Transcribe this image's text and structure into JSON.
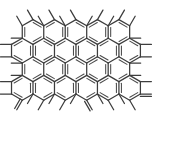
{
  "figure": {
    "title": "Polycyclic aromatic hydrocarbon lattice",
    "kind": "chemical-structure-diagram",
    "background_color": "#ffffff",
    "bond_color": "#3d3d3d",
    "inner_bond_color": "#4a4a4a",
    "bond_width": 1.25,
    "canvas": {
      "width": 184,
      "height": 144
    }
  },
  "lattice": {
    "orientation": "pointy-top",
    "hex_radius": 12.4,
    "origin_x": 33.0,
    "origin_y": 32.0,
    "col_step_x": 21.48,
    "row_step_y": 18.6,
    "rows": [
      {
        "index": 0,
        "count": 5,
        "offset_x": 0.0,
        "offset_y": 0.0
      },
      {
        "index": 1,
        "count": 6,
        "offset_x": -10.74,
        "offset_y": 18.6
      },
      {
        "index": 2,
        "count": 5,
        "offset_x": 0.0,
        "offset_y": 37.2
      },
      {
        "index": 3,
        "count": 6,
        "offset_x": -10.74,
        "offset_y": 55.8
      }
    ]
  },
  "substituents": {
    "methyl_length": 11.0,
    "top_stub_count": 5,
    "bottom_stub_count": 5,
    "left_stub_count": 3,
    "right_stub_count": 3,
    "double_bond_offset": 2.4,
    "exocyclic_double_bonds": [
      {
        "position": "left-lower",
        "label": "methylene"
      },
      {
        "position": "bottom-center",
        "label": "methylene"
      },
      {
        "position": "right-lower",
        "label": "methylene"
      }
    ]
  },
  "chart_data": {
    "type": "diagram",
    "title": "Polycyclic aromatic hydrocarbon lattice",
    "hexagon_rows": 4,
    "hexagons_per_row": [
      5,
      6,
      5,
      6
    ],
    "total_hexagons": 22,
    "peripheral_methyl_groups": 16,
    "exocyclic_double_bonds": 3,
    "xlabel": "",
    "ylabel": "",
    "legend": []
  }
}
